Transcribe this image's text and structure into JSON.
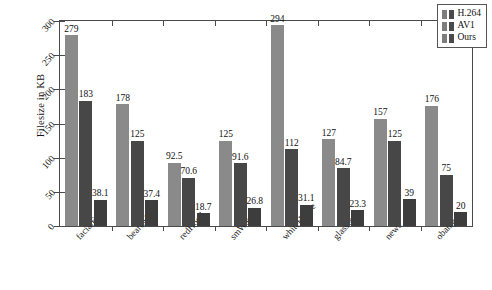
{
  "chart_data": {
    "type": "bar",
    "title": "",
    "xlabel": "",
    "ylabel": "Filesize in KB",
    "ylim": [
      0,
      300
    ],
    "yticks": [
      0,
      50,
      100,
      150,
      200,
      250,
      300
    ],
    "ytick_labels": [
      "0",
      "50",
      "100",
      "150",
      "200",
      "250",
      "300"
    ],
    "grid": false,
    "legend_position": "upper right",
    "categories": [
      "facialExp",
      "beardMan",
      "redHood",
      "smWoman",
      "whiteHouse",
      "glasses",
      "news",
      "obama"
    ],
    "series": [
      {
        "name": "H.264",
        "color": "#8a8a8a",
        "values": [
          279,
          178,
          92.5,
          125,
          294,
          127,
          157,
          176
        ],
        "labels": [
          "279",
          "178",
          "92.5",
          "125",
          "294",
          "127",
          "157",
          "176"
        ]
      },
      {
        "name": "AV1",
        "color": "#474747",
        "values": [
          183,
          125,
          70.6,
          91.6,
          112,
          84.7,
          125,
          75
        ],
        "labels": [
          "183",
          "125",
          "70.6",
          "91.6",
          "112",
          "84.7",
          "125",
          "75"
        ]
      },
      {
        "name": "Ours",
        "color": "#3d3d3d",
        "values": [
          38.1,
          37.4,
          18.7,
          26.8,
          31.1,
          23.3,
          39,
          20
        ],
        "labels": [
          "38.1",
          "37.4",
          "18.7",
          "26.8",
          "31.1",
          "23.3",
          "39",
          "20"
        ]
      }
    ]
  },
  "legend": {
    "entries": [
      {
        "label": "H.264"
      },
      {
        "label": "AV1"
      },
      {
        "label": "Ours"
      }
    ]
  }
}
